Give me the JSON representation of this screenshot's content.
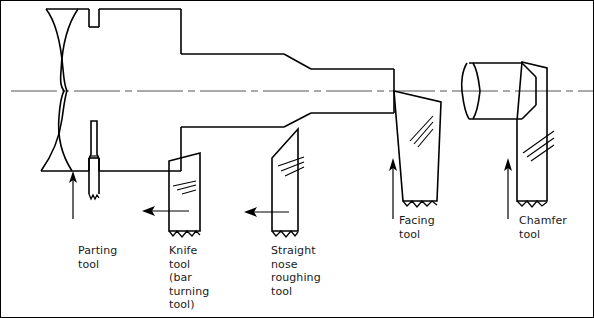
{
  "figure": {
    "type": "engineering-diagram",
    "background_color": "#ffffff",
    "line_color": "#000000",
    "centerline_color": "#555555",
    "text_color": "#1a1a1a"
  },
  "workpieces": [
    {
      "name": "main-workpiece",
      "description": "Stepped cylindrical bar with break line at left end",
      "features": [
        "break-line-left",
        "parting-groove",
        "step-large",
        "taper-step",
        "step-medium",
        "faced-end"
      ]
    },
    {
      "name": "right-workpiece",
      "description": "Short cylinder with chamfered right end and break line at left",
      "features": [
        "break-line-left",
        "chamfer-right"
      ]
    }
  ],
  "tools": [
    {
      "id": "parting-tool",
      "label": "Parting\ntool",
      "label_x": 77,
      "label_y": 243,
      "feed_direction": "up",
      "arrow": "vertical-up"
    },
    {
      "id": "knife-tool",
      "label": "Knife\ntool\n(bar\nturning\ntool)",
      "label_x": 168,
      "label_y": 243,
      "feed_direction": "left",
      "arrow": "horizontal-left"
    },
    {
      "id": "straight-nose-roughing-tool",
      "label": "Straight\nnose\nroughing\ntool",
      "label_x": 270,
      "label_y": 243,
      "feed_direction": "left",
      "arrow": "horizontal-left"
    },
    {
      "id": "facing-tool",
      "label": "Facing\ntool",
      "label_x": 398,
      "label_y": 213,
      "feed_direction": "up",
      "arrow": "vertical-up"
    },
    {
      "id": "chamfer-tool",
      "label": "Chamfer\ntool",
      "label_x": 518,
      "label_y": 213,
      "feed_direction": "up",
      "arrow": "vertical-up"
    }
  ],
  "centerline": {
    "name": "axis-centerline",
    "y": 90,
    "style": "dash-dot"
  }
}
